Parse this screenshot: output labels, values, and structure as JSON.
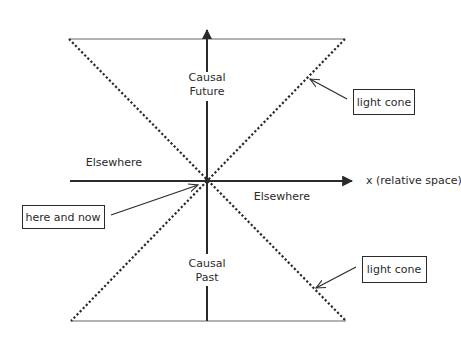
{
  "diagram": {
    "colors": {
      "background": "#ffffff",
      "ink": "#2a2a2a",
      "thin_line": "#555555"
    },
    "origin": {
      "x": 207,
      "y": 181
    },
    "axes": {
      "time_axis": {
        "x": 207,
        "y_top": 24,
        "y_bottom": 321
      },
      "space_axis": {
        "y": 181,
        "x_left": 70,
        "x_right": 354,
        "label": "x (relative space)"
      }
    },
    "light_cone": {
      "top_left": {
        "x": 69,
        "y": 39
      },
      "top_right": {
        "x": 345,
        "y": 39
      },
      "bottom_left": {
        "x": 71,
        "y": 321
      },
      "bottom_right": {
        "x": 346,
        "y": 321
      }
    },
    "regions": {
      "future": {
        "line1": "Causal",
        "line2": "Future"
      },
      "past": {
        "line1": "Causal",
        "line2": "Past"
      },
      "elsewhere_left": "Elsewhere",
      "elsewhere_right": "Elsewhere"
    },
    "callouts": [
      {
        "label": "light cone",
        "box": {
          "x": 353,
          "y": 89,
          "w": 61,
          "h": 25
        }
      },
      {
        "label": "here and now",
        "box": {
          "x": 22,
          "y": 205,
          "w": 82,
          "h": 23
        }
      },
      {
        "label": "light cone",
        "box": {
          "x": 362,
          "y": 256,
          "w": 64,
          "h": 26
        }
      }
    ]
  }
}
